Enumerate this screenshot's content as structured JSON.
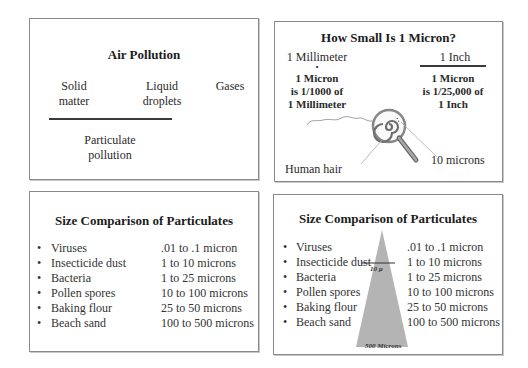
{
  "panels": {
    "air_pollution": {
      "title": "Air Pollution",
      "categories": [
        {
          "line1": "Solid",
          "line2": "matter"
        },
        {
          "line1": "Liquid",
          "line2": "droplets"
        },
        {
          "line1": "Gases"
        }
      ],
      "group_label": {
        "line1": "Particulate",
        "line2": "pollution"
      }
    },
    "micron": {
      "title": "How Small Is 1 Micron?",
      "left": {
        "header": "1 Millimeter",
        "marker": "•",
        "line1": "1 Micron",
        "line2": "is 1/1000 of",
        "line3": "1 Millimeter"
      },
      "right": {
        "header": "1 Inch",
        "line1": "1 Micron",
        "line2": "is 1/25,000 of",
        "line3": "1 Inch"
      },
      "labels": {
        "hair": "Human hair",
        "ten_microns": "10 microns"
      },
      "icons": [
        "magnifying-glass-icon",
        "hair-icon"
      ]
    },
    "size_comparison_list": {
      "title": "Size Comparison of Particulates",
      "bullet": "•",
      "items": [
        {
          "name": "Viruses",
          "size": ".01 to .1 micron"
        },
        {
          "name": "Insecticide dust",
          "size": "1 to 10 microns"
        },
        {
          "name": "Bacteria",
          "size": "1 to 25 microns"
        },
        {
          "name": "Pollen spores",
          "size": "10 to 100 microns"
        },
        {
          "name": "Baking flour",
          "size": "25 to 50 microns"
        },
        {
          "name": "Beach sand",
          "size": "100 to 500 microns"
        }
      ]
    },
    "size_comparison_triangle": {
      "title": "Size Comparison of Particulates",
      "bullet": "•",
      "items": [
        {
          "name": "Viruses",
          "size": ".01 to .1 micron"
        },
        {
          "name": "Insecticide dust",
          "size": "1 to 10 microns"
        },
        {
          "name": "Bacteria",
          "size": "1 to 25 microns"
        },
        {
          "name": "Pollen spores",
          "size": "10 to 100 microns"
        },
        {
          "name": "Baking flour",
          "size": "25 to 50 microns"
        },
        {
          "name": "Beach sand",
          "size": "100 to 500 microns"
        }
      ],
      "triangle_mark": "10 µ",
      "triangle_base": "500 Microns",
      "triangle_color": "#b4b4b4"
    }
  }
}
